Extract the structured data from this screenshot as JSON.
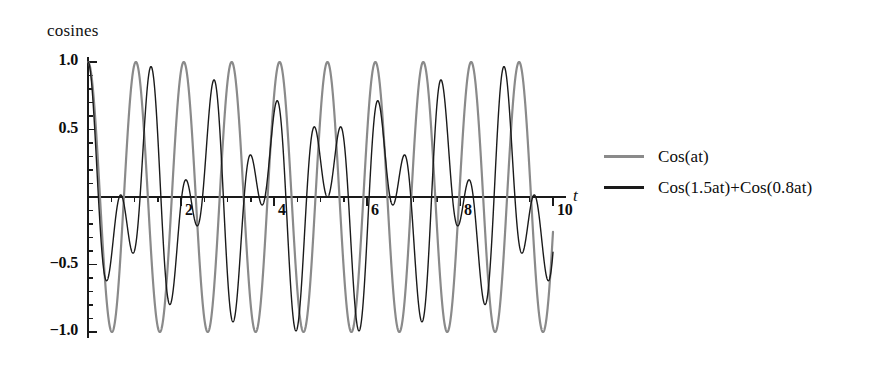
{
  "chart_data": {
    "type": "line",
    "title": "",
    "ylabel": "cosines",
    "xlabel": "t",
    "xlim": [
      0,
      10
    ],
    "ylim": [
      -1.05,
      1.05
    ],
    "grid": false,
    "legend_position": "right",
    "x_ticks": [
      {
        "value": 2,
        "label": "2"
      },
      {
        "value": 4,
        "label": "4"
      },
      {
        "value": 6,
        "label": "6"
      },
      {
        "value": 8,
        "label": "8"
      },
      {
        "value": 10,
        "label": "10"
      }
    ],
    "y_ticks": [
      {
        "value": 1.0,
        "label": "1.0"
      },
      {
        "value": 0.5,
        "label": "0.5"
      },
      {
        "value": -0.5,
        "label": "-0.5"
      },
      {
        "value": -1.0,
        "label": "-1.0"
      }
    ],
    "y_minor_tick_step": 0.1,
    "series": [
      {
        "name": "Cos(at)",
        "expression": "cos(a*t)",
        "a": 6.1,
        "color": "#8a8a8a",
        "width": 2.2,
        "amplitude": 1.0
      },
      {
        "name": "Cos(1.5at)+Cos(0.8at)",
        "expression": "cos(1.5*a*t)+cos(0.8*a*t)",
        "a": 6.1,
        "color": "#1a1a1a",
        "width": 1.4,
        "amplitude": 0.5
      }
    ]
  },
  "labels": {
    "y_axis_title": "cosines",
    "x_axis_title": "t"
  },
  "legend": {
    "entries": [
      {
        "label": "Cos(at)",
        "color": "#8a8a8a",
        "style": "gray-line"
      },
      {
        "label": "Cos(1.5at)+Cos(0.8at)",
        "color": "#1a1a1a",
        "style": "black-line"
      }
    ]
  },
  "colors": {
    "background": "#ffffff",
    "axis": "#1a1a1a",
    "series_gray": "#8a8a8a",
    "series_black": "#1a1a1a"
  }
}
